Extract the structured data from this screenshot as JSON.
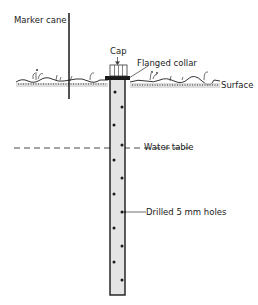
{
  "diagram": {
    "labels": {
      "marker_cane": "Marker cane",
      "cap": "Cap",
      "flanged_collar": "Flanged collar",
      "surface": "Surface",
      "water_table": "Water table",
      "drilled_holes": "Drilled 5 mm holes"
    },
    "colors": {
      "line": "#1a1a1a",
      "tube_fill": "#e4e4e4",
      "ground": "#9a9a9a",
      "background": "#ffffff"
    }
  }
}
